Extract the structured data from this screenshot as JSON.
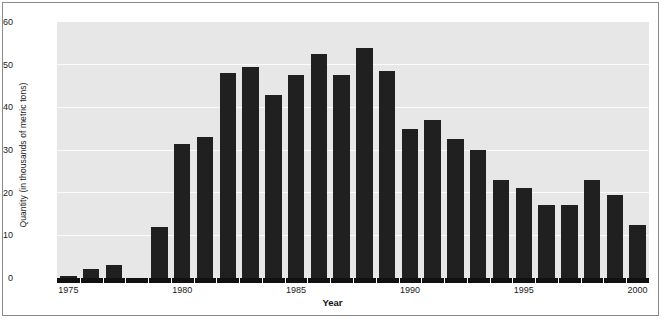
{
  "chart_data": {
    "type": "bar",
    "title": "",
    "xlabel": "Year",
    "ylabel": "Quantity (in thousands of metric tons)",
    "xlim": [
      1974.5,
      2000.5
    ],
    "ylim": [
      0,
      60
    ],
    "yticks": [
      0,
      10,
      20,
      30,
      40,
      50,
      60
    ],
    "xticks": [
      1975,
      1980,
      1985,
      1990,
      1995,
      2000
    ],
    "xtick_labels": [
      "1975",
      "1980",
      "1985",
      "1990",
      "1995",
      "2000"
    ],
    "grid": "horizontal-white",
    "legend": "none",
    "bar_color": "#202020",
    "plot_background": "#e7e7e7",
    "categories": [
      "1975",
      "1976",
      "1977",
      "1978",
      "1979",
      "1980",
      "1981",
      "1982",
      "1983",
      "1984",
      "1985",
      "1986",
      "1987",
      "1988",
      "1989",
      "1990",
      "1991",
      "1992",
      "1993",
      "1994",
      "1995",
      "1996",
      "1997",
      "1998",
      "1999",
      "2000"
    ],
    "values": [
      0.5,
      2.0,
      3.0,
      0,
      12.0,
      31.5,
      33.0,
      48.0,
      49.5,
      43.0,
      47.5,
      52.5,
      47.5,
      54.0,
      48.5,
      35.0,
      37.0,
      32.5,
      30.0,
      23.0,
      21.0,
      17.0,
      17.0,
      23.0,
      19.5,
      12.5
    ]
  },
  "axis": {
    "y_title": "Quantity (in thousands of metric tons)",
    "x_title": "Year"
  },
  "caption": {
    "text": ""
  }
}
